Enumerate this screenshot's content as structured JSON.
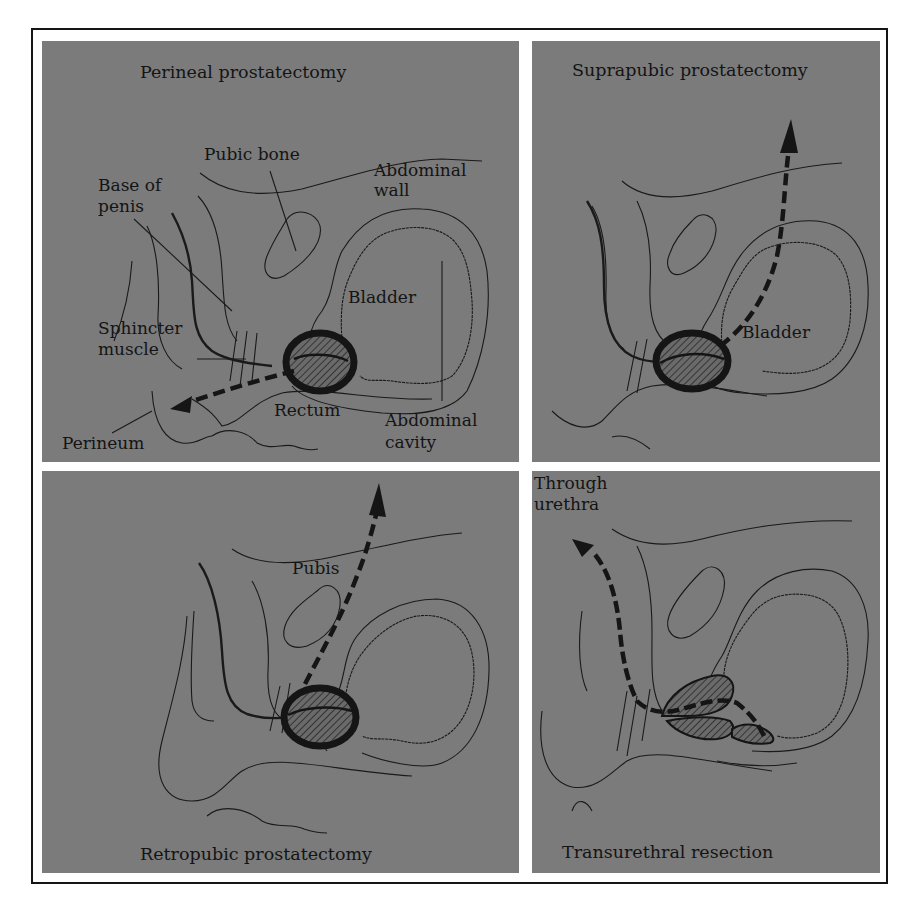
{
  "figure": {
    "panels": [
      {
        "id": "perineal",
        "title": "Perineal prostatectomy",
        "labels": {
          "pubic_bone": "Pubic bone",
          "abdominal_wall_1": "Abdominal",
          "abdominal_wall_2": "wall",
          "base_of_penis_1": "Base of",
          "base_of_penis_2": "penis",
          "bladder": "Bladder",
          "sphincter_1": "Sphincter",
          "sphincter_2": "muscle",
          "rectum": "Rectum",
          "abdominal_cavity_1": "Abdominal",
          "abdominal_cavity_2": "cavity",
          "perineum": "Perineum"
        }
      },
      {
        "id": "suprapubic",
        "title": "Suprapubic prostatectomy",
        "labels": {
          "bladder": "Bladder"
        }
      },
      {
        "id": "retropubic",
        "title": "Retropubic prostatectomy",
        "labels": {
          "pubis": "Pubis"
        }
      },
      {
        "id": "transurethral",
        "title": "Transurethral resection",
        "labels": {
          "through_1": "Through",
          "through_2": "urethra"
        }
      }
    ],
    "colors": {
      "panel_bg": "#7b7b7b",
      "ink": "#141414",
      "page_bg": "#ffffff"
    }
  }
}
